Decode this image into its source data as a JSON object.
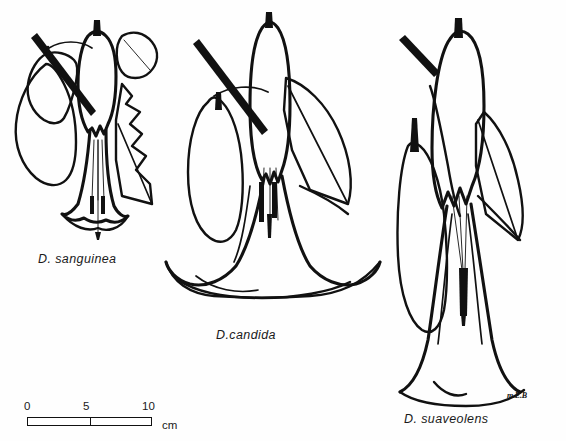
{
  "plate": {
    "title": "Comparative line drawings of three Datura species",
    "background_color": "#fefefe",
    "ink_color": "#111111",
    "width": 566,
    "height": 441
  },
  "specimens": [
    {
      "label": "D. sanguinea",
      "position": "left",
      "features": "pendulous flower with toothed leaf, narrow tubular corolla, exserted style and dark anthers"
    },
    {
      "label": "D.candida",
      "position": "center",
      "features": "broadly flared trumpet corolla with strongly recurved reflexed rim, elongate calyx"
    },
    {
      "label": "D. suaveolens",
      "position": "right",
      "features": "long narrow tube widening to a flared mouth, spathaceous calyx with pointed lobes"
    }
  ],
  "scale": {
    "ticks": [
      "0",
      "5",
      "10"
    ],
    "unit": "cm",
    "bar_length_cm": 10
  },
  "credit": {
    "monogram": "m.E.B"
  }
}
